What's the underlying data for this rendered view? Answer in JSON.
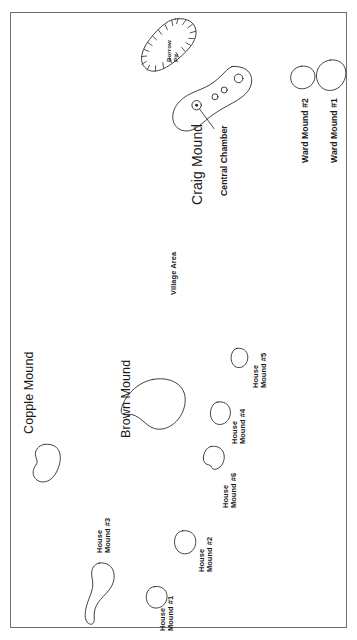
{
  "map": {
    "title": "Archaeological site plan of mound group",
    "frame": {
      "stroke": "#6e6e6e"
    },
    "ink": "#2b2b2b",
    "background": "#ffffff",
    "features": [
      {
        "id": "borrow-pit",
        "name": "Borrow Pit",
        "label": "Borrow\nPit",
        "type": "depression",
        "label_size": "tiny"
      },
      {
        "id": "craig-mound",
        "name": "Craig Mound",
        "label": "Craig Mound",
        "type": "mound",
        "label_size": "craig"
      },
      {
        "id": "central-chamber",
        "name": "Central Chamber",
        "label": "Central Chamber",
        "type": "annotation-leader",
        "label_size": "mid"
      },
      {
        "id": "ward-mound-2",
        "name": "Ward Mound #2",
        "label": "Ward Mound #2",
        "type": "mound",
        "label_size": "mid"
      },
      {
        "id": "ward-mound-1",
        "name": "Ward Mound #1",
        "label": "Ward Mound #1",
        "type": "mound",
        "label_size": "mid"
      },
      {
        "id": "village-area",
        "name": "Village Area",
        "label": "Village Area",
        "type": "area",
        "label_size": "small"
      },
      {
        "id": "copple-mound",
        "name": "Copple Mound",
        "label": "Copple Mound",
        "type": "mound",
        "label_size": "major"
      },
      {
        "id": "brown-mound",
        "name": "Brown Mound",
        "label": "Brown Mound",
        "type": "mound",
        "label_size": "major"
      },
      {
        "id": "house-mound-3",
        "name": "House Mound #3",
        "label": "House\nMound #3",
        "type": "mound",
        "label_size": "small"
      },
      {
        "id": "house-mound-1",
        "name": "House Mound #1",
        "label": "House\nMound #1",
        "type": "mound",
        "label_size": "small"
      },
      {
        "id": "house-mound-2",
        "name": "House Mound #2",
        "label": "House\nMound #2",
        "type": "mound",
        "label_size": "small"
      },
      {
        "id": "house-mound-6",
        "name": "House Mound #6",
        "label": "House\nMound #6",
        "type": "mound",
        "label_size": "small"
      },
      {
        "id": "house-mound-4",
        "name": "House Mound #4",
        "label": "House\nMound #4",
        "type": "mound",
        "label_size": "small"
      },
      {
        "id": "house-mound-5",
        "name": "House Mound #5",
        "label": "House\nMound #5",
        "type": "mound",
        "label_size": "small"
      }
    ]
  },
  "labels": {
    "borrow_pit": "Borrow\nPit",
    "craig_mound": "Craig Mound",
    "central_chamber": "Central Chamber",
    "ward_mound_2": "Ward Mound #2",
    "ward_mound_1": "Ward Mound #1",
    "village_area": "Village Area",
    "copple_mound": "Copple Mound",
    "brown_mound": "Brown Mound",
    "house_mound_3": "House\nMound #3",
    "house_mound_1": "House\nMound #1",
    "house_mound_2": "House\nMound #2",
    "house_mound_6": "House\nMound #6",
    "house_mound_4": "House\nMound #4",
    "house_mound_5": "House\nMound #5"
  }
}
